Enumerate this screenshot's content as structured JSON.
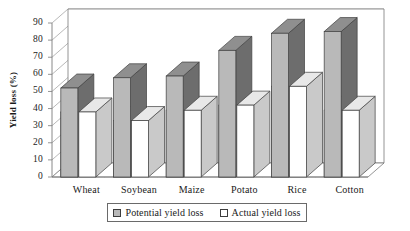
{
  "chart_data": {
    "type": "bar",
    "title": "",
    "subtitle": "",
    "xlabel": "",
    "ylabel": "Yield loss (%)",
    "categories": [
      "Wheat",
      "Soybean",
      "Maize",
      "Potato",
      "Rice",
      "Cotton"
    ],
    "series": [
      {
        "name": "Potential yield loss",
        "values": [
          52,
          58,
          59,
          74,
          84,
          85
        ],
        "color": "#b9b9b9"
      },
      {
        "name": "Actual yield loss",
        "values": [
          38,
          33,
          39,
          42,
          53,
          39
        ],
        "color": "#ffffff"
      }
    ],
    "ylim": [
      0,
      90
    ],
    "ytick_step": 10,
    "yticks": [
      "90",
      "80",
      "70",
      "60",
      "50",
      "40",
      "30",
      "20",
      "10",
      "0"
    ],
    "grid": true,
    "legend_position": "bottom",
    "style": "3d-column"
  },
  "legend": {
    "entries": [
      {
        "label": "Potential yield loss",
        "swatch": "potential"
      },
      {
        "label": "Actual yield loss",
        "swatch": "actual"
      }
    ]
  },
  "colors": {
    "potential_fill": "#b9b9b9",
    "potential_side": "#6d6d6d",
    "potential_top": "#8f8f8f",
    "actual_fill": "#ffffff",
    "actual_side": "#c9c9c9",
    "actual_top": "#e8e8e8",
    "axis": "#7a7a7a",
    "grid": "#9a9a9a",
    "text": "#1a1a1a"
  }
}
